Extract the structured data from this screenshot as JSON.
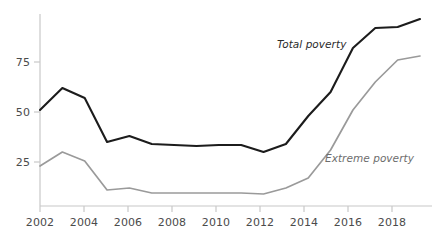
{
  "chart_data": {
    "type": "line",
    "title": "",
    "subtitle": "",
    "xlabel": "",
    "ylabel": "",
    "grid": false,
    "legend_position": "inline-annotation",
    "x": [
      2002,
      2003,
      2004,
      2005,
      2006,
      2007,
      2008,
      2009,
      2010,
      2011,
      2012,
      2013,
      2014,
      2015,
      2016,
      2017,
      2018,
      2019
    ],
    "xlim": [
      2002,
      2019
    ],
    "ylim": [
      0,
      100
    ],
    "xticks": [
      2002,
      2004,
      2006,
      2008,
      2010,
      2012,
      2014,
      2016,
      2018
    ],
    "xtick_labels": [
      "2002",
      "2004",
      "2006",
      "2008",
      "2010",
      "2012",
      "2014",
      "2016",
      "2018"
    ],
    "yticks": [
      25,
      50,
      75
    ],
    "ytick_labels": [
      "25",
      "50",
      "75"
    ],
    "series": [
      {
        "name": "Total poverty",
        "color": "#1c1c1c",
        "values": [
          51,
          62,
          57,
          35,
          38,
          34,
          33.5,
          33,
          33.5,
          33.5,
          30,
          34,
          48,
          60,
          82,
          92,
          92.5,
          96.5
        ]
      },
      {
        "name": "Extreme poverty",
        "color": "#9a9a9a",
        "values": [
          23,
          30,
          25.5,
          11,
          12,
          9.5,
          9.5,
          9.5,
          9.5,
          9.5,
          9,
          12,
          17,
          31,
          51,
          65,
          76,
          78
        ]
      }
    ],
    "annotations": [
      {
        "text": "Total poverty",
        "series": "Total poverty"
      },
      {
        "text": "Extreme poverty",
        "series": "Extreme poverty"
      }
    ]
  },
  "axis": {
    "y_tick_0": "75",
    "y_tick_1": "50",
    "y_tick_2": "25",
    "x_tick_0": "2002",
    "x_tick_1": "2004",
    "x_tick_2": "2006",
    "x_tick_3": "2008",
    "x_tick_4": "2010",
    "x_tick_5": "2012",
    "x_tick_6": "2014",
    "x_tick_7": "2016",
    "x_tick_8": "2018"
  },
  "labels": {
    "total_poverty": "Total poverty",
    "extreme_poverty": "Extreme poverty"
  },
  "colors": {
    "total_line": "#1c1c1c",
    "extreme_line": "#9a9a9a",
    "axis": "#bdbdbd",
    "text": "#4b4b4b"
  }
}
